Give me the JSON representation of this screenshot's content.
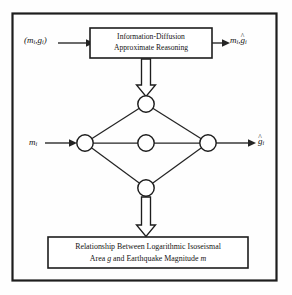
{
  "figure": {
    "type": "flow-diagram",
    "frame": {
      "border_color": "#1d1d1d"
    },
    "colors": {
      "stroke": "#1d1d1d",
      "line": "#242424",
      "fill": "#ffffff",
      "background": "#fefefe"
    }
  },
  "top_box": {
    "line1": "Information-Diffusion",
    "line2": "Approximate Reasoning"
  },
  "caption_box": {
    "line1": "Relationship Between Logarithmic Isoseismal",
    "line2_before": "Area ",
    "line2_italic_1": "g",
    "line2_middle": " and Earthquake Magnitude ",
    "line2_italic_2": "m"
  },
  "labels": {
    "input_pair_open": "(",
    "input_pair_m": "m",
    "input_pair_m_sub": "i",
    "input_pair_comma": ",",
    "input_pair_g": "g",
    "input_pair_g_sub": "i",
    "input_pair_close": ")",
    "output_pair_m": "m",
    "output_pair_m_sub": "i",
    "output_pair_comma": ",",
    "output_pair_g": "g",
    "output_pair_g_hat": "^",
    "output_pair_g_sub": "i",
    "m_input": "m",
    "m_input_sub": "i",
    "g_output": "g",
    "g_output_hat": "^",
    "g_output_sub": "i"
  },
  "network": {
    "nodes": [
      {
        "id": "left",
        "name": "node-left",
        "cx": 85,
        "cy": 143,
        "r": 8.2
      },
      {
        "id": "top",
        "name": "node-top",
        "cx": 146,
        "cy": 104,
        "r": 8.2
      },
      {
        "id": "center",
        "name": "node-center",
        "cx": 146,
        "cy": 143,
        "r": 8.2
      },
      {
        "id": "bottom",
        "name": "node-bottom",
        "cx": 146,
        "cy": 188,
        "r": 8.2
      },
      {
        "id": "right",
        "name": "node-right",
        "cx": 208,
        "cy": 143,
        "r": 8.2
      }
    ],
    "edges": [
      {
        "from": "left",
        "to": "top"
      },
      {
        "from": "left",
        "to": "center"
      },
      {
        "from": "left",
        "to": "bottom"
      },
      {
        "from": "top",
        "to": "right"
      },
      {
        "from": "center",
        "to": "right"
      },
      {
        "from": "bottom",
        "to": "right"
      }
    ]
  },
  "connectors": {
    "input_arrow": "arrow-right",
    "output_arrow": "arrow-right",
    "m_arrow": "arrow-right",
    "g_arrow": "arrow-right",
    "down_arrow_top": "hollow-block-arrow-down",
    "down_arrow_bottom": "hollow-block-arrow-down"
  }
}
